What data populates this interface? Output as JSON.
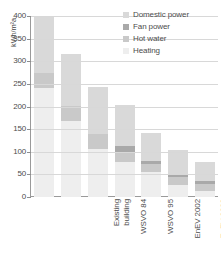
{
  "chart_data": {
    "type": "bar",
    "stacked": true,
    "title": "",
    "xlabel": "",
    "ylabel": "kWh/m²a",
    "ylim": [
      0,
      400
    ],
    "ytick_labels": [
      "400",
      "350",
      "300",
      "250",
      "200",
      "150",
      "100",
      "50",
      "0"
    ],
    "ytick_values": [
      400,
      350,
      300,
      250,
      200,
      150,
      100,
      50,
      0
    ],
    "grid": true,
    "legend_position": "top-right",
    "categories": [
      "Existing building",
      "WSVO 84",
      "WSVO 95",
      "EnEV 2002",
      "EnEV 2009",
      "EnEV 2012",
      "Passive house"
    ],
    "series": [
      {
        "name": "Heating",
        "color": "#eeeeee",
        "values": [
          240,
          168,
          107,
          77,
          56,
          27,
          13
        ]
      },
      {
        "name": "Hot water",
        "color": "#c9c9c9",
        "values": [
          35,
          33,
          32,
          22,
          16,
          17,
          16
        ]
      },
      {
        "name": "Fan power",
        "color": "#a9a9a9",
        "values": [
          0,
          0,
          0,
          13,
          7,
          6,
          6
        ]
      },
      {
        "name": "Domestic power",
        "color": "#d9d9d9",
        "values": [
          122,
          114,
          104,
          91,
          63,
          55,
          43
        ]
      }
    ],
    "totals": [
      397,
      315,
      243,
      203,
      142,
      105,
      78
    ]
  },
  "legend": {
    "items": [
      {
        "label": "Domestic power",
        "color": "#d9d9d9"
      },
      {
        "label": "Fan power",
        "color": "#a9a9a9"
      },
      {
        "label": "Hot water",
        "color": "#c9c9c9"
      },
      {
        "label": "Heating",
        "color": "#eeeeee"
      }
    ]
  },
  "axis": {
    "y_title": "kWh/m²a"
  }
}
